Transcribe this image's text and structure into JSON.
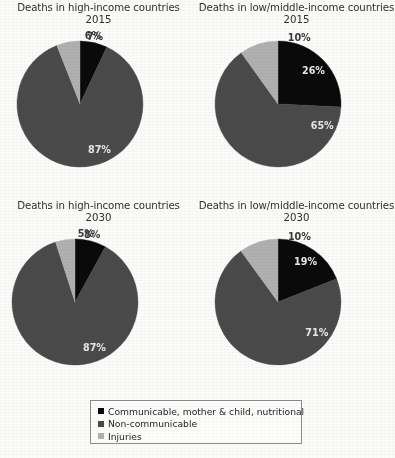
{
  "figure": {
    "background_color": "#fbfbfa",
    "title_font_size_px": 10
  },
  "colors": {
    "communicable": "#0a0a0a",
    "non_communicable": "#4a4a4a",
    "injuries": "#b0b0b0",
    "label_on_dark": "#e9e9e9",
    "label_outside": "#3a3a3a",
    "legend_border": "#8d8d8d"
  },
  "legend": {
    "position": "bottom-center",
    "items": [
      {
        "label": "Communicable, mother & child, nutritional",
        "color": "#0a0a0a",
        "swatch_name": "square-swatch-communicable"
      },
      {
        "label": "Non-communicable",
        "color": "#4a4a4a",
        "swatch_name": "square-swatch-non-communicable"
      },
      {
        "label": "Injuries",
        "color": "#b0b0b0",
        "swatch_name": "square-swatch-injuries"
      }
    ]
  },
  "charts": [
    {
      "id": "high-income-2015",
      "title": "Deaths in high-income countries",
      "year": "2015",
      "labels": [
        "7%",
        "87%",
        "6%"
      ]
    },
    {
      "id": "low-middle-income-2015",
      "title": "Deaths in low/middle-income countries",
      "year": "2015",
      "labels": [
        "26%",
        "65%",
        "10%"
      ]
    },
    {
      "id": "high-income-2030",
      "title": "Deaths in high-income countries",
      "year": "2030",
      "labels": [
        "8%",
        "87%",
        "5%"
      ]
    },
    {
      "id": "low-middle-income-2030",
      "title": "Deaths in low/middle-income countries",
      "year": "2030",
      "labels": [
        "19%",
        "71%",
        "10%"
      ]
    }
  ],
  "chart_data": [
    {
      "type": "pie",
      "title": "Deaths in high-income countries",
      "subtitle": "2015",
      "categories": [
        "Communicable, mother & child, nutritional",
        "Non-communicable",
        "Injuries"
      ],
      "values": [
        7,
        87,
        6
      ],
      "value_labels": [
        "7%",
        "87%",
        "6%"
      ],
      "colors": [
        "#0a0a0a",
        "#4a4a4a",
        "#b0b0b0"
      ],
      "units": "percent",
      "start_angle_deg": 0,
      "direction": "clockwise",
      "legend_position": "figure-bottom"
    },
    {
      "type": "pie",
      "title": "Deaths in low/middle-income countries",
      "subtitle": "2015",
      "categories": [
        "Communicable, mother & child, nutritional",
        "Non-communicable",
        "Injuries"
      ],
      "values": [
        26,
        65,
        10
      ],
      "value_labels": [
        "26%",
        "65%",
        "10%"
      ],
      "colors": [
        "#0a0a0a",
        "#4a4a4a",
        "#b0b0b0"
      ],
      "units": "percent",
      "start_angle_deg": 0,
      "direction": "clockwise",
      "legend_position": "figure-bottom"
    },
    {
      "type": "pie",
      "title": "Deaths in high-income countries",
      "subtitle": "2030",
      "categories": [
        "Communicable, mother & child, nutritional",
        "Non-communicable",
        "Injuries"
      ],
      "values": [
        8,
        87,
        5
      ],
      "value_labels": [
        "8%",
        "87%",
        "5%"
      ],
      "colors": [
        "#0a0a0a",
        "#4a4a4a",
        "#b0b0b0"
      ],
      "units": "percent",
      "start_angle_deg": 0,
      "direction": "clockwise",
      "legend_position": "figure-bottom"
    },
    {
      "type": "pie",
      "title": "Deaths in low/middle-income countries",
      "subtitle": "2030",
      "categories": [
        "Communicable, mother & child, nutritional",
        "Non-communicable",
        "Injuries"
      ],
      "values": [
        19,
        71,
        10
      ],
      "value_labels": [
        "19%",
        "71%",
        "10%"
      ],
      "colors": [
        "#0a0a0a",
        "#4a4a4a",
        "#b0b0b0"
      ],
      "units": "percent",
      "start_angle_deg": 0,
      "direction": "clockwise",
      "legend_position": "figure-bottom"
    }
  ]
}
